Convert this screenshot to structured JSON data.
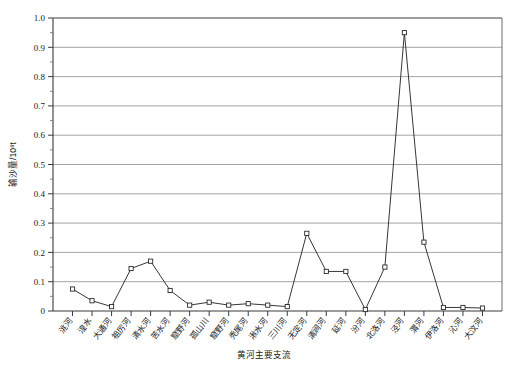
{
  "chart_data": {
    "type": "line",
    "title": "",
    "xlabel": "黄河主要支流",
    "ylabel": "输沙量/10⁸t",
    "ylim": [
      0,
      1.0
    ],
    "ytick_labels": [
      "0",
      "0.1",
      "0.2",
      "0.3",
      "0.4",
      "0.5",
      "0.6",
      "0.7",
      "0.8",
      "0.9",
      "1.0"
    ],
    "ytick_values": [
      0,
      0.1,
      0.2,
      0.3,
      0.4,
      0.5,
      0.6,
      0.7,
      0.8,
      0.9,
      1.0
    ],
    "grid": "horizontal",
    "legend": "none",
    "marker": "open-square",
    "categories": [
      "洮河",
      "湟水",
      "大通河",
      "祖厉河",
      "清水河",
      "苦水河",
      "窟野河",
      "孤山川",
      "窟野河",
      "秃尾河",
      "湫水河",
      "三川河",
      "无定河",
      "清涧河",
      "延河",
      "汾河",
      "北洛河",
      "泾河",
      "渭河",
      "伊洛河",
      "沁河",
      "大汶河"
    ],
    "xtick_labels": [
      "洮河",
      "湟水",
      "大通河",
      "祖厉河",
      "清水河",
      "苦水河",
      "窟野河",
      "孤山川",
      "窟野河",
      "秃尾河",
      "湫水河",
      "三川河",
      "无定河",
      "清涧河",
      "延河",
      "汾河",
      "北洛河",
      "泾河",
      "渭河",
      "伊洛河",
      "沁河",
      "大汶河"
    ],
    "values": [
      0.075,
      0.035,
      0.015,
      0.145,
      0.17,
      0.07,
      0.02,
      0.03,
      0.02,
      0.025,
      0.02,
      0.015,
      0.265,
      0.135,
      0.135,
      0.005,
      0.15,
      0.95,
      0.235,
      0.012,
      0.012,
      0.01
    ],
    "series": [
      {
        "name": "输沙量",
        "values": [
          0.075,
          0.035,
          0.015,
          0.145,
          0.17,
          0.07,
          0.02,
          0.03,
          0.02,
          0.025,
          0.02,
          0.015,
          0.265,
          0.135,
          0.135,
          0.005,
          0.15,
          0.95,
          0.235,
          0.012,
          0.012,
          0.01
        ]
      }
    ]
  }
}
